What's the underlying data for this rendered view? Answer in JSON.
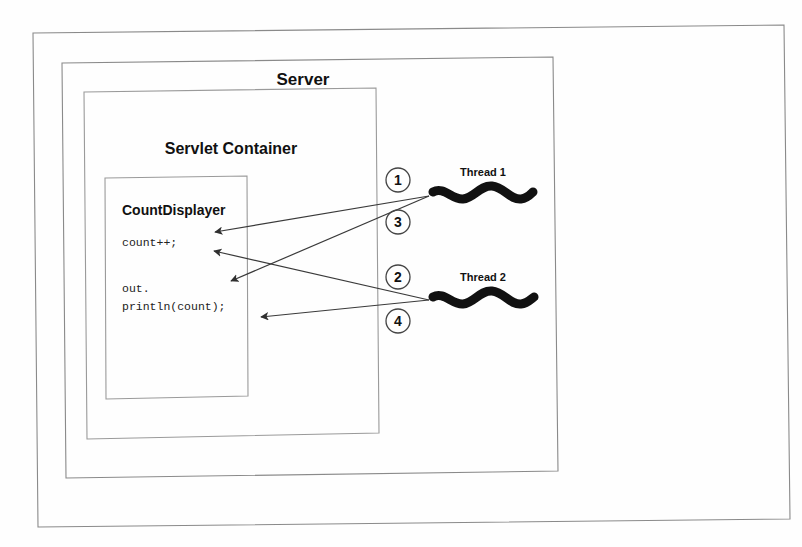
{
  "diagram": {
    "background_color": "#fefefe",
    "line_color": "#8a8a8a",
    "ink_color": "#111111",
    "outer_frame_label": "",
    "boxes": {
      "server": {
        "label": "Server"
      },
      "servlet_container": {
        "label": "Servlet Container"
      },
      "count_displayer": {
        "label": "CountDisplayer"
      }
    },
    "code_lines": [
      "count++;",
      "out.",
      "println(count);"
    ],
    "threads": [
      {
        "label": "Thread 1",
        "icon": "squiggle-icon"
      },
      {
        "label": "Thread 2",
        "icon": "squiggle-icon"
      }
    ],
    "steps": [
      {
        "number": "1",
        "from": "Thread 1",
        "to": "count++;"
      },
      {
        "number": "3",
        "from": "Thread 1",
        "to": "out. println(count);"
      },
      {
        "number": "2",
        "from": "Thread 2",
        "to": "count++;"
      },
      {
        "number": "4",
        "from": "Thread 2",
        "to": "println(count);"
      }
    ]
  }
}
